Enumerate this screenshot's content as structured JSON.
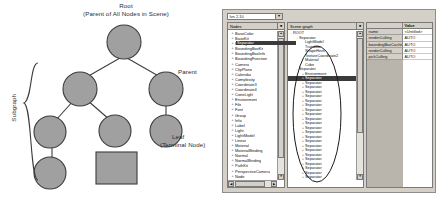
{
  "diagram": {
    "title_line1": "Root",
    "title_line2": "(Parent of All Nodes in Scene)",
    "parent_label": "Parent",
    "leaf_label_line1": "Leaf",
    "leaf_label_line2": "(Terminal Node)",
    "subgraph_label": "Subgraph",
    "node_fill": "#a0a0a0",
    "node_stroke": "#3c3c3c",
    "text_color": "#2b2b2b"
  },
  "app": {
    "combo": {
      "value": "Ivn 2.10",
      "arrow": "▼"
    },
    "node_panel": {
      "header": "Nodes",
      "header_button": "■",
      "items": [
        "BaseColor",
        "BaseKit",
        "Boxing",
        "BoundingBoxKit",
        "BoundingBoxInfo",
        "BoundingFunction",
        "Camera",
        "ClipPlane",
        "Calendar",
        "Complexity",
        "Coordinate3",
        "Coordinate4",
        "ConeLight",
        "Environment",
        "File",
        "Font",
        "Group",
        "Info",
        "Label",
        "Light",
        "LightModel",
        "Linear",
        "Material",
        "MaterialBinding",
        "Normal",
        "NormalBinding",
        "PathKit",
        "PerspectiveCamera",
        "Node",
        "ProfileCoordinate2",
        "ProfileCoordinate3",
        "SceneTexture2"
      ],
      "scroll_up": "▲",
      "scroll_down": "▼",
      "scroll_left": "◀",
      "scroll_right": "▶"
    },
    "tree_panel": {
      "header": "Scene graph",
      "header_button": "■",
      "root": "ROOT",
      "group_one": "Separator",
      "group_one_children": [
        "LightModel",
        "Translate",
        "ShapeHints",
        "TextureCoordinate2",
        "Material",
        "Cube"
      ],
      "group_two": "Separator",
      "selected_above": "Environment",
      "selected": "Separator",
      "separators_count": 26,
      "separator_label": "Separator",
      "last_item": "Separator",
      "expand_glyph": "+",
      "collapse_glyph": "-",
      "scroll_up": "▲",
      "scroll_down": "▼"
    },
    "props_panel": {
      "col_name_header": "",
      "col_value_header": "Value",
      "rows": [
        {
          "name": "name",
          "value": "<Untitled>"
        },
        {
          "name": "renderCulling",
          "value": "AUTO"
        },
        {
          "name": "boundingBoxCaching",
          "value": "AUTO"
        },
        {
          "name": "renderCulling",
          "value": "AUTO"
        },
        {
          "name": "pickCulling",
          "value": "AUTO"
        }
      ]
    },
    "chrome": {
      "window_bg": "#d4d0c8",
      "selection_bg": "#3a3a3a",
      "annotation_stroke": "#1a1a1a"
    }
  }
}
